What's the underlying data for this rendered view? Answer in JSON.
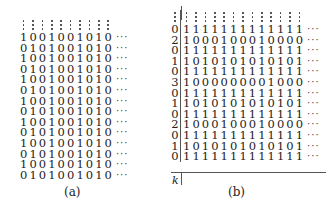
{
  "figure": {
    "panel_a": {
      "caption": "(a)",
      "columns": 10,
      "continuation": "···",
      "rows": [
        "1001001010",
        "0101001010",
        "1001001010",
        "0101001010",
        "1001001010",
        "0101001010",
        "1001001010",
        "0101001010",
        "1001001010",
        "0101001010",
        "1001001010",
        "0101001010",
        "1001001010",
        "0101001010"
      ]
    },
    "panel_b": {
      "caption": "(b)",
      "axis_label": "k",
      "columns": 13,
      "continuation": "···",
      "rows": [
        {
          "label": "0",
          "bits": "1111111111111"
        },
        {
          "label": "2",
          "bits": "1000100010000"
        },
        {
          "label": "0",
          "bits": "1111111111111"
        },
        {
          "label": "1",
          "bits": "1010101010101"
        },
        {
          "label": "0",
          "bits": "1111111111111"
        },
        {
          "label": "3",
          "bits": "1000000001000"
        },
        {
          "label": "0",
          "bits": "1111111111111"
        },
        {
          "label": "1",
          "bits": "1010101010101"
        },
        {
          "label": "0",
          "bits": "1111111111111"
        },
        {
          "label": "2",
          "bits": "1000100010000"
        },
        {
          "label": "0",
          "bits": "1111111111111"
        },
        {
          "label": "1",
          "bits": "1010101010101"
        },
        {
          "label": "0",
          "bits": "1111111111111"
        }
      ]
    }
  }
}
